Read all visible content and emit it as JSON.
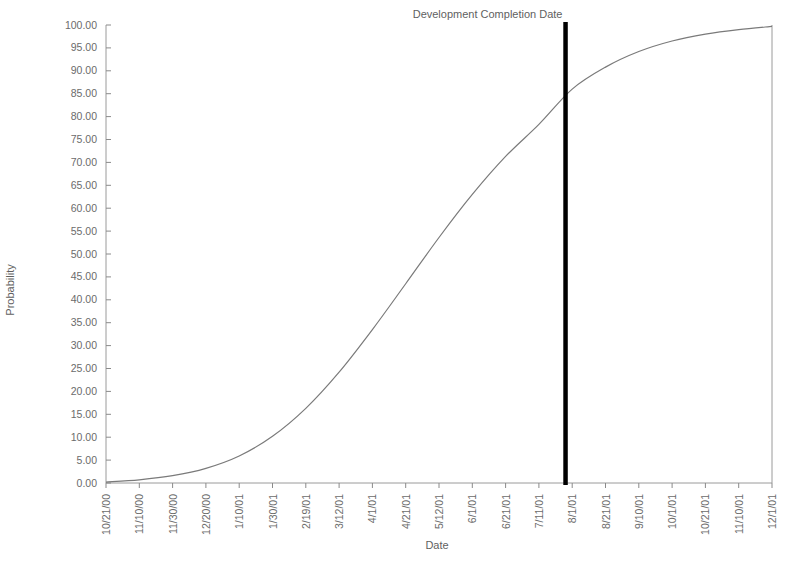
{
  "chart_data": {
    "type": "line",
    "title": "",
    "xlabel": "Date",
    "ylabel": "Probability",
    "ylim": [
      0,
      100
    ],
    "ytick_step": 5,
    "grid": false,
    "legend": null,
    "curve_color": "#7a7a7a",
    "marker_color": "#000000",
    "axis_color": "#8a8a8a",
    "yticks": [
      "0.00",
      "5.00",
      "10.00",
      "15.00",
      "20.00",
      "25.00",
      "30.00",
      "35.00",
      "40.00",
      "45.00",
      "50.00",
      "55.00",
      "60.00",
      "65.00",
      "70.00",
      "75.00",
      "80.00",
      "85.00",
      "90.00",
      "95.00",
      "100.00"
    ],
    "ytick_values": [
      0,
      5,
      10,
      15,
      20,
      25,
      30,
      35,
      40,
      45,
      50,
      55,
      60,
      65,
      70,
      75,
      80,
      85,
      90,
      95,
      100
    ],
    "categories": [
      "10/21/00",
      "11/10/00",
      "11/30/00",
      "12/20/00",
      "1/10/01",
      "1/30/01",
      "2/19/01",
      "3/12/01",
      "4/1/01",
      "4/21/01",
      "5/12/01",
      "6/1/01",
      "6/21/01",
      "7/11/01",
      "8/1/01",
      "8/21/01",
      "9/10/01",
      "10/1/01",
      "10/21/01",
      "11/10/01",
      "12/1/01"
    ],
    "x_index": [
      0,
      1,
      2,
      3,
      4,
      5,
      6,
      7,
      8,
      9,
      10,
      11,
      12,
      13,
      14,
      15,
      16,
      17,
      18,
      19,
      20
    ],
    "series": [
      {
        "name": "Cumulative Probability",
        "values": [
          0.2,
          0.7,
          1.6,
          3.2,
          5.9,
          10.2,
          16.3,
          24.2,
          33.5,
          43.5,
          53.6,
          63.0,
          71.3,
          78.3,
          86.0,
          90.8,
          94.2,
          96.5,
          98.0,
          99.0,
          99.7
        ]
      }
    ],
    "annotations": [
      {
        "name": "development-completion-date",
        "label": "Development Completion Date",
        "type": "vertical-line",
        "x_value": "7/27/01",
        "x_index": 13.8,
        "crosses_at_probability": 83.0
      }
    ]
  }
}
